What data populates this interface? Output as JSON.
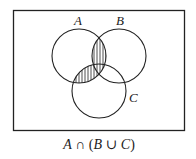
{
  "diagram": {
    "type": "venn",
    "sets": [
      {
        "name": "A",
        "label": "A",
        "cx": 79,
        "cy": 56,
        "r": 27
      },
      {
        "name": "B",
        "label": "B",
        "cx": 119,
        "cy": 56,
        "r": 27
      },
      {
        "name": "C",
        "label": "C",
        "cx": 99,
        "cy": 91,
        "r": 27
      }
    ],
    "universe": {
      "x": 13,
      "y": 10,
      "width": 172,
      "height": 121
    },
    "shaded_region": "A ∩ (B ∪ C)",
    "shading_style": "vertical-hatch",
    "caption": "A ∩ (B ∪ C)",
    "caption_parts": {
      "a": "A",
      "cap": " ∩ (",
      "b": "B",
      "cup": " ∪ ",
      "c": "C",
      "close": ")"
    },
    "colors": {
      "stroke": "#222222",
      "background": "#ffffff"
    }
  }
}
